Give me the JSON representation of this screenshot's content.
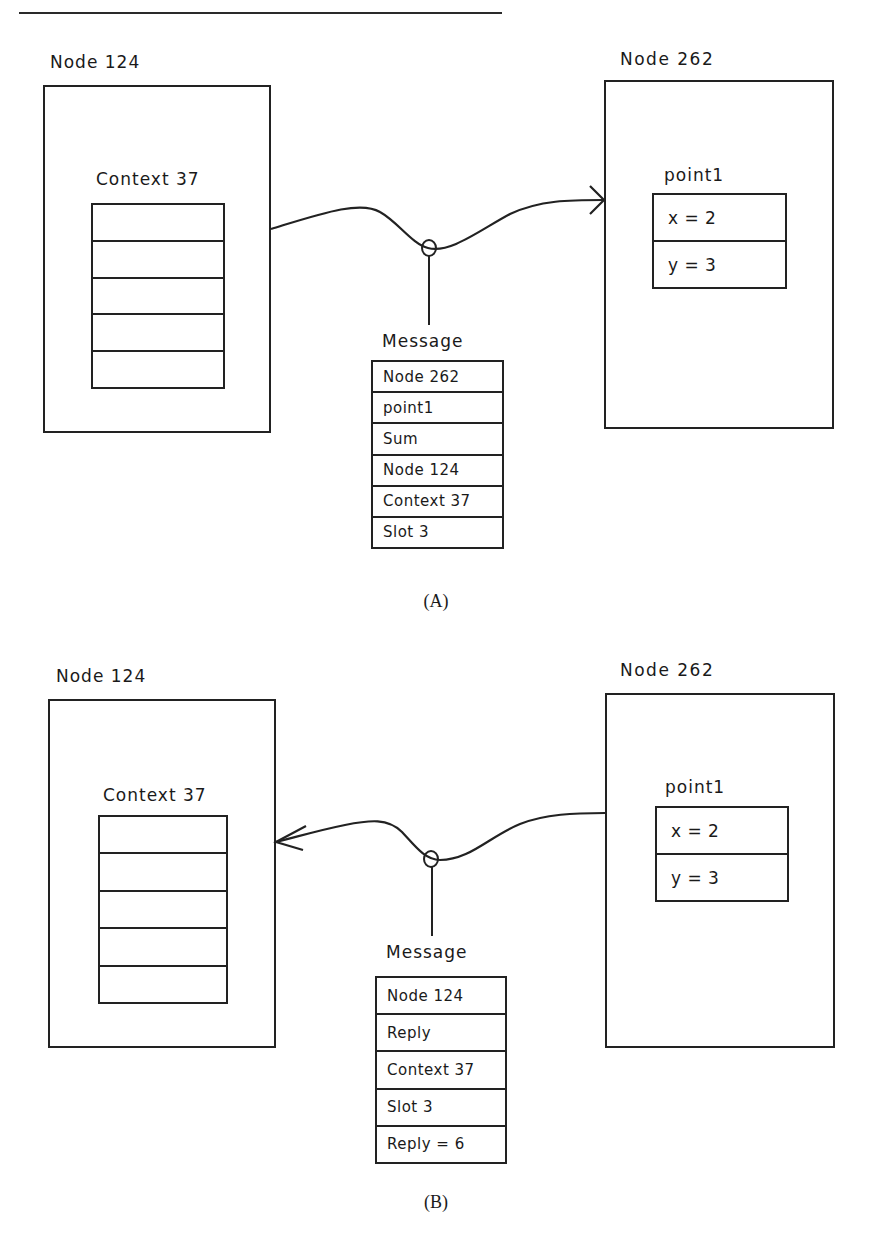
{
  "header": {
    "running_head": "... parallel object-oriented computing ..."
  },
  "panels": [
    {
      "caption": "(A)",
      "direction": "request",
      "left_node": {
        "label": "Node 124",
        "context_label": "Context 37",
        "context_slots": [
          "",
          "",
          "",
          "",
          ""
        ]
      },
      "right_node": {
        "label": "Node 262",
        "object_label": "point1",
        "fields": [
          "x = 2",
          "y = 3"
        ]
      },
      "message": {
        "label": "Message",
        "fields": [
          "Node 262",
          "point1",
          "Sum",
          "Node 124",
          "Context 37",
          "Slot 3"
        ]
      }
    },
    {
      "caption": "(B)",
      "direction": "reply",
      "left_node": {
        "label": "Node 124",
        "context_label": "Context 37",
        "context_slots": [
          "",
          "",
          "",
          "",
          ""
        ]
      },
      "right_node": {
        "label": "Node 262",
        "object_label": "point1",
        "fields": [
          "x = 2",
          "y = 3"
        ]
      },
      "message": {
        "label": "Message",
        "fields": [
          "Node 124",
          "Reply",
          "Context 37",
          "Slot 3",
          "Reply = 6"
        ]
      }
    }
  ],
  "colors": {
    "ink": "#222222",
    "background": "#ffffff"
  }
}
